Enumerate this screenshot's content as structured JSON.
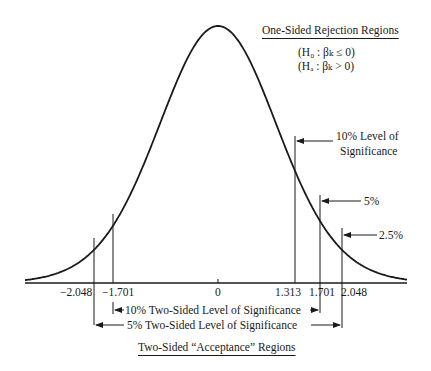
{
  "chart_data": {
    "type": "line",
    "curve": "Student t density (bell-shaped), centered at 0",
    "x_ticks": [
      "-2.048",
      "-1.701",
      "0",
      "1.313",
      "1.701",
      "2.048"
    ],
    "critical_values": [
      {
        "value": -2.048,
        "label": "-2.048"
      },
      {
        "value": -1.701,
        "label": "-1.701"
      },
      {
        "value": 1.313,
        "label": "1.313",
        "annotation": "10% Level of Significance"
      },
      {
        "value": 1.701,
        "label": "1.701",
        "annotation": "5%"
      },
      {
        "value": 2.048,
        "label": "2.048",
        "annotation": "2.5%"
      }
    ],
    "one_sided": {
      "title": "One-Sided Rejection Regions",
      "h0": "(H₀ : βₖ ≤ 0)",
      "ha": "(Hₐ : βₖ > 0)"
    },
    "two_sided": {
      "title": "Two-Sided “Acceptance” Regions",
      "ranges": [
        {
          "from": -1.701,
          "to": 1.701,
          "label": "10% Two-Sided Level of Significance"
        },
        {
          "from": -2.048,
          "to": 2.048,
          "label": "5% Two-Sided Level of Significance"
        }
      ]
    }
  },
  "labels": {
    "one_sided_title": "One-Sided Rejection Regions",
    "h0": "(H₀ : βₖ ≤ 0)",
    "ha": "(Hₐ : βₖ > 0)",
    "ten_pct_line1": "10% Level of",
    "ten_pct_line2": "Significance",
    "five_pct": "5%",
    "two_half_pct": "2.5%",
    "tick_m2048": "−2.048",
    "tick_m1701": "−1.701",
    "tick_0": "0",
    "tick_1313": "1.313",
    "tick_1701": "1.701",
    "tick_2048": "2.048",
    "range_10": "10% Two-Sided Level of Significance",
    "range_5": "5% Two-Sided Level of Significance",
    "two_sided_title": "Two-Sided “Acceptance” Regions"
  }
}
